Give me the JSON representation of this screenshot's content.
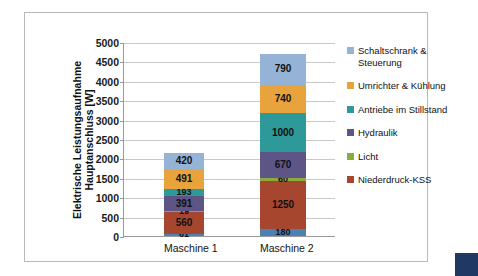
{
  "chart_data": {
    "type": "bar",
    "subtype": "stacked-column",
    "title": "",
    "xlabel": "",
    "ylabel": "Elektrische Leistungsaufnahme Hauptanschluss [W]",
    "ylim": [
      0,
      5000
    ],
    "ytick_step": 500,
    "yticks": [
      "5000",
      "4500",
      "4000",
      "3500",
      "3000",
      "2500",
      "2000",
      "1500",
      "1000",
      "500",
      "0"
    ],
    "categories": [
      "Maschine 1",
      "Maschine 2"
    ],
    "grid": true,
    "legend_position": "right",
    "legend_order_top_down": [
      "Schaltschrank & Steuerung",
      "Umrichter & Kühlung",
      "Antriebe im Stillstand",
      "Hydraulik",
      "Licht",
      "Niederdruck-KSS"
    ],
    "series": [
      {
        "name": "Sonstige",
        "color": "#4a82b4",
        "in_legend": false,
        "values": [
          61,
          180
        ]
      },
      {
        "name": "Niederdruck-KSS",
        "color": "#a6462e",
        "in_legend": true,
        "values": [
          560,
          1250
        ]
      },
      {
        "name": "Licht",
        "color": "#8bab3f",
        "in_legend": true,
        "values": [
          19,
          60
        ]
      },
      {
        "name": "Hydraulik",
        "color": "#5c5586",
        "in_legend": true,
        "values": [
          391,
          670
        ]
      },
      {
        "name": "Antriebe im Stillstand",
        "color": "#2e9999",
        "in_legend": true,
        "values": [
          193,
          1000
        ]
      },
      {
        "name": "Umrichter & Kühlung",
        "color": "#e8a33d",
        "in_legend": true,
        "values": [
          491,
          740
        ]
      },
      {
        "name": "Schaltschrank & Steuerung",
        "color": "#95b3d7",
        "in_legend": true,
        "values": [
          420,
          790
        ]
      }
    ],
    "totals": [
      2145,
      4690
    ],
    "value_labels": {
      "Maschine 1": [
        "420",
        "491",
        "193",
        "391",
        "19",
        "560",
        "61"
      ],
      "Maschine 2": [
        "790",
        "740",
        "1000",
        "670",
        "60",
        "1250",
        "180"
      ]
    }
  },
  "legend": {
    "items": [
      {
        "label": "Schaltschrank & Steuerung",
        "color": "#95b3d7"
      },
      {
        "label": "Umrichter & Kühlung",
        "color": "#e8a33d"
      },
      {
        "label": "Antriebe im Stillstand",
        "color": "#2e9999"
      },
      {
        "label": "Hydraulik",
        "color": "#5c5586"
      },
      {
        "label": "Licht",
        "color": "#8bab3f"
      },
      {
        "label": "Niederdruck-KSS",
        "color": "#a6462e"
      }
    ]
  },
  "accent": {
    "color": "#1f3864"
  }
}
